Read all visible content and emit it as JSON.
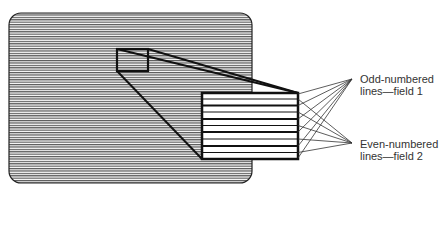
{
  "diagram": {
    "labels": {
      "odd_line1": "Odd-numbered",
      "odd_line2": "lines—field 1",
      "even_line1": "Even-numbered",
      "even_line2": "lines—field 2"
    },
    "colors": {
      "stroke": "#111111",
      "scanline": "#555555",
      "background": "#ffffff"
    }
  }
}
